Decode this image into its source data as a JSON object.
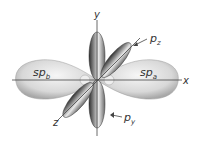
{
  "diagram": {
    "axes": {
      "x_label": "x",
      "y_label": "y",
      "z_label": "z"
    },
    "orbitals": {
      "sp_b": {
        "label": "sp",
        "subscript": "b"
      },
      "sp_a": {
        "label": "sp",
        "subscript": "a"
      },
      "p_z": {
        "label": "p",
        "subscript": "z"
      },
      "p_y": {
        "label": "p",
        "subscript": "y"
      }
    },
    "colors": {
      "lobe_light": "#f2f2f2",
      "lobe_mid": "#bdbdbd",
      "lobe_dark": "#3a3a3a",
      "axis": "#444444",
      "text": "#333333"
    }
  }
}
